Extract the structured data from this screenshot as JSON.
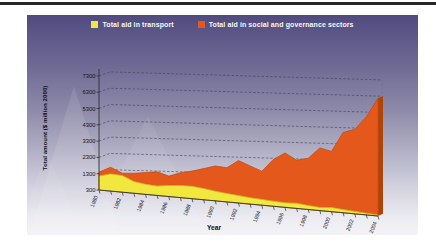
{
  "chart_data": {
    "type": "area",
    "style": "3d-area-perspective",
    "title": "",
    "x": [
      1980,
      1981,
      1982,
      1983,
      1984,
      1985,
      1986,
      1987,
      1988,
      1989,
      1990,
      1991,
      1992,
      1993,
      1994,
      1995,
      1996,
      1997,
      1998,
      1999,
      2000,
      2001,
      2002,
      2003,
      2004
    ],
    "series": [
      {
        "name": "Total aid in transport",
        "color": "#f2e73e",
        "edge_color": "#c6ba25",
        "values": [
          1150,
          1350,
          1300,
          1000,
          900,
          850,
          950,
          1000,
          1020,
          950,
          850,
          780,
          720,
          660,
          620,
          580,
          550,
          580,
          520,
          470,
          520,
          470,
          430,
          390,
          350
        ]
      },
      {
        "name": "Total aid in social and governance sectors",
        "color": "#e4581b",
        "edge_color": "#c44e10",
        "side_color": "#b04407",
        "values": [
          1400,
          1750,
          1450,
          1500,
          1600,
          1700,
          1500,
          1750,
          1900,
          2100,
          2300,
          2250,
          2700,
          2450,
          2200,
          2900,
          3300,
          2950,
          3100,
          3700,
          3550,
          4600,
          4800,
          5500,
          6500
        ]
      }
    ],
    "xlabel": "Year",
    "ylabel": "Total amount ($ million 2000)",
    "ylim": [
      300,
      7300
    ],
    "yticks": [
      300,
      1300,
      2300,
      3300,
      4300,
      5300,
      6300,
      7300
    ],
    "xticks": [
      1980,
      1982,
      1984,
      1986,
      1988,
      1990,
      1992,
      1994,
      1996,
      1998,
      2000,
      2002,
      2004
    ],
    "legend_position": "top",
    "grid": true
  }
}
